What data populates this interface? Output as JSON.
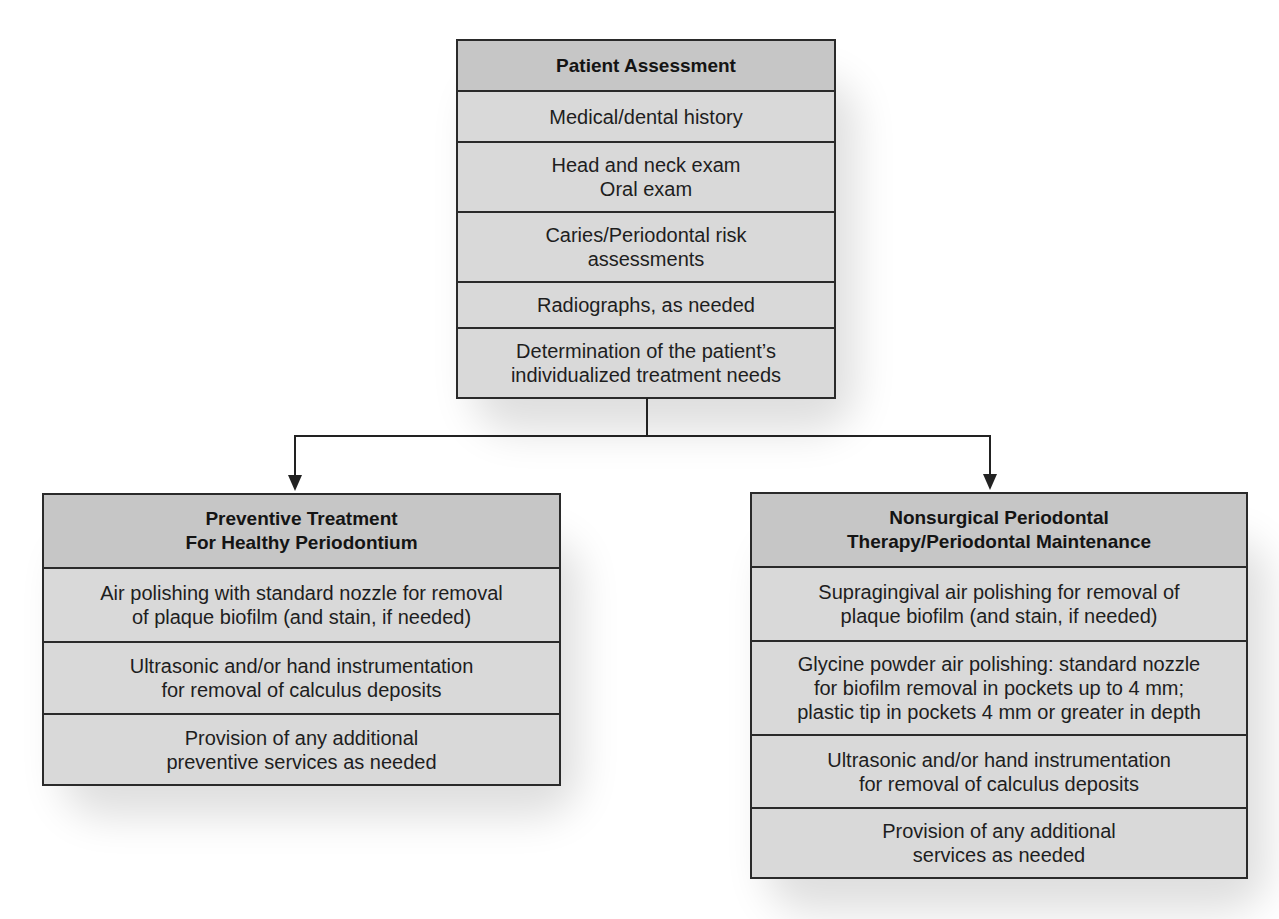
{
  "diagram": {
    "type": "flowchart",
    "colors": {
      "header_fill": "#c6c6c6",
      "body_fill": "#d9d9d9",
      "border": "#2a2a2a",
      "text": "#1e1e1e"
    },
    "top_box": {
      "title": "Patient Assessment",
      "rows": [
        "Medical/dental history",
        "Head and neck exam\nOral exam",
        "Caries/Periodontal risk\nassessments",
        "Radiographs, as needed",
        "Determination of the patient’s\nindividualized treatment needs"
      ]
    },
    "left_box": {
      "title": "Preventive Treatment\nFor Healthy Periodontium",
      "rows": [
        "Air polishing with standard nozzle for removal\nof plaque biofilm (and stain, if needed)",
        "Ultrasonic and/or hand instrumentation\nfor removal of calculus deposits",
        "Provision of any additional\npreventive services as needed"
      ]
    },
    "right_box": {
      "title": "Nonsurgical Periodontal\nTherapy/Periodontal Maintenance",
      "rows": [
        "Supragingival air polishing for removal of\nplaque biofilm (and stain, if needed)",
        "Glycine powder air polishing: standard nozzle\nfor biofilm removal in pockets up to 4 mm;\nplastic tip in pockets 4 mm or greater in depth",
        "Ultrasonic and/or hand instrumentation\nfor removal of calculus deposits",
        "Provision of any additional\nservices as needed"
      ]
    },
    "connectors": [
      {
        "from": "top_box",
        "to": "left_box"
      },
      {
        "from": "top_box",
        "to": "right_box"
      }
    ]
  }
}
